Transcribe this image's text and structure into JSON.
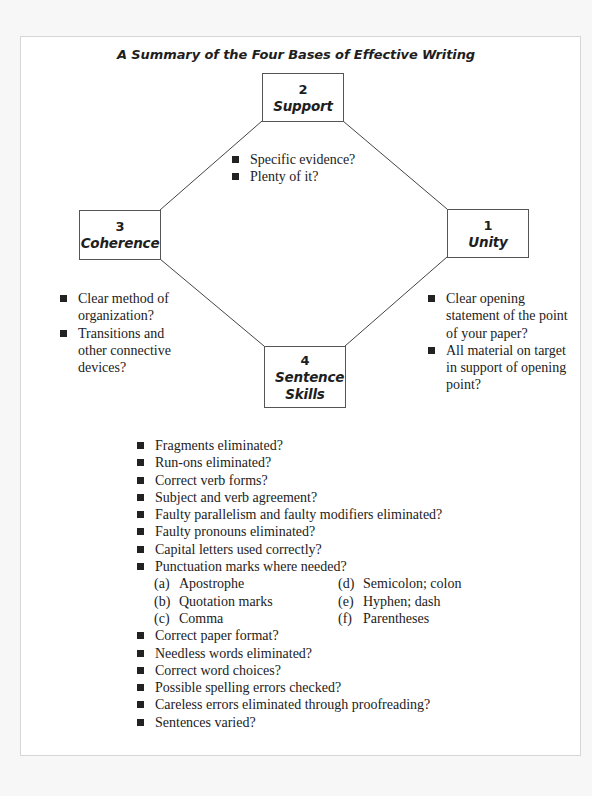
{
  "title": "A Summary of the Four Bases of Effective Writing",
  "colors": {
    "page_background": "#f7f7f7",
    "frame_background": "#ffffff",
    "frame_border": "#d6d6d6",
    "box_border": "#555555",
    "text": "#1e1e1e"
  },
  "boxes": {
    "support": {
      "number": "2",
      "label": "Support"
    },
    "coherence": {
      "number": "3",
      "label": "Coherence"
    },
    "unity": {
      "number": "1",
      "label": "Unity"
    },
    "sentence_skills": {
      "number": "4",
      "label": "Sentence Skills"
    }
  },
  "support_points": [
    "Specific evidence?",
    "Plenty of it?"
  ],
  "coherence_points": [
    "Clear method of organization?",
    "Transitions and other connective devices?"
  ],
  "unity_points": [
    "Clear opening statement of the point of your paper?",
    "All material on target in support of opening point?"
  ],
  "sentence_skills_points": {
    "before_punctuation": [
      "Fragments eliminated?",
      "Run-ons eliminated?",
      "Correct verb forms?",
      "Subject and verb agreement?",
      "Faulty parallelism and faulty modifiers eliminated?",
      "Faulty pronouns eliminated?",
      "Capital letters used correctly?",
      "Punctuation marks where needed?"
    ],
    "punctuation_marks": [
      {
        "letter": "(a)",
        "text": "Apostrophe"
      },
      {
        "letter": "(d)",
        "text": "Semicolon; colon"
      },
      {
        "letter": "(b)",
        "text": "Quotation marks"
      },
      {
        "letter": "(e)",
        "text": "Hyphen; dash"
      },
      {
        "letter": "(c)",
        "text": "Comma"
      },
      {
        "letter": "(f)",
        "text": "Parentheses"
      }
    ],
    "after_punctuation": [
      "Correct paper format?",
      "Needless words eliminated?",
      "Correct word choices?",
      "Possible spelling errors checked?",
      "Careless errors eliminated through proofreading?",
      "Sentences varied?"
    ]
  }
}
